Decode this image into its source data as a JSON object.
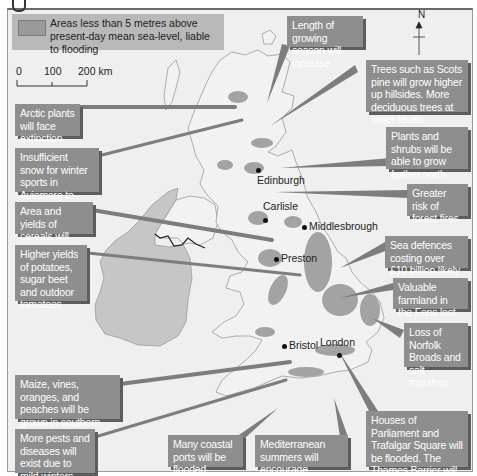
{
  "legend": {
    "swatch_label": "Areas less than 5 metres above present-day mean sea-level, liable to flooding",
    "swatch_color": "#9a9a9a"
  },
  "scale_bar": {
    "ticks": [
      "0",
      "100",
      "200 km"
    ]
  },
  "compass": {
    "label": "N"
  },
  "cities": [
    {
      "name": "Edinburgh"
    },
    {
      "name": "Carlisle"
    },
    {
      "name": "Middlesbrough"
    },
    {
      "name": "Preston"
    },
    {
      "name": "Bristol"
    },
    {
      "name": "London"
    }
  ],
  "callouts": {
    "growing_season": "Length of growing season will increase",
    "trees": "Trees such as Scots pine will grow higher up hillsides. More deciduous trees at lower levels",
    "arctic_plants": "Arctic plants will face extinction",
    "snow": "Insufficient snow for winter sports in Aviemore to continue",
    "plants_shrubs": "Plants and shrubs will be able to grow further north",
    "forest_fires": "Greater risk of forest fires",
    "cereals": "Area and yields of cereals will increase",
    "sea_defences": "Sea defences costing over £10 billion likely",
    "potatoes": "Higher yields of potatoes, sugar beet and outdoor tomatoes",
    "fens": "Valuable farmland in the Fens lost",
    "norfolk": "Loss of Norfolk Broads and salt marshes",
    "maize": "Maize, vines, oranges, and peaches will be grown in southern England",
    "pests": "More pests and diseases will exist due to mild winters",
    "ports": "Many coastal ports will be flooded",
    "mediterranean": "Mediterranean summers will encourage tourism",
    "parliament": "Houses of Parliament and Trafalgar Square will be flooded. The Thames Barrier will be ineffectual"
  },
  "colors": {
    "background": "#efefef",
    "callout_box": "#8e8e8e",
    "callout_shadow": "#5d5d5d",
    "legend_box": "#b9b9b9",
    "ireland": "#c6c6c6",
    "flood_area": "#a3a3a3",
    "pointer": "#7d7d7d"
  }
}
